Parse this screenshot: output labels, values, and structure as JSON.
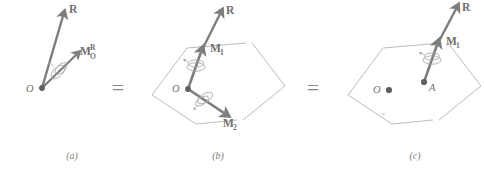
{
  "figure": {
    "background_color": "#ffffff",
    "vector_color": "#7d7d7d",
    "plane_color": "#b3b3b3",
    "label_color": "#6f6f6f",
    "caption_color": "#7a7a7a",
    "equals_symbol": "=",
    "panels": [
      {
        "id": "a",
        "caption": "(a)",
        "point_labels": [
          {
            "name": "origin",
            "text": "O"
          }
        ],
        "vectors": [
          {
            "name": "resultant-force",
            "base": "R",
            "sup": "",
            "sub": ""
          },
          {
            "name": "resultant-moment",
            "base": "M",
            "sup": "R",
            "sub": "O"
          }
        ]
      },
      {
        "id": "b",
        "caption": "(b)",
        "point_labels": [
          {
            "name": "origin",
            "text": "O"
          }
        ],
        "vectors": [
          {
            "name": "resultant-force",
            "base": "R",
            "sup": "",
            "sub": ""
          },
          {
            "name": "moment-parallel",
            "base": "M",
            "sup": "",
            "sub": "1"
          },
          {
            "name": "moment-perpendicular",
            "base": "M",
            "sup": "",
            "sub": "2"
          }
        ]
      },
      {
        "id": "c",
        "caption": "(c)",
        "point_labels": [
          {
            "name": "origin",
            "text": "O"
          },
          {
            "name": "point-a",
            "text": "A"
          }
        ],
        "vectors": [
          {
            "name": "resultant-force",
            "base": "R",
            "sup": "",
            "sub": ""
          },
          {
            "name": "moment-parallel",
            "base": "M",
            "sup": "",
            "sub": "1"
          }
        ]
      }
    ]
  }
}
